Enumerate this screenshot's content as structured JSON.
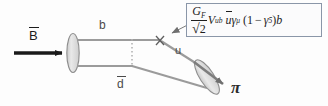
{
  "figure": {
    "kind": "feynman-diagram",
    "title_visible": false,
    "background_color": "#fdfdfd"
  },
  "labels": {
    "incoming_particle": "B",
    "incoming_particle_has_overbar": true,
    "quark_top": "b",
    "quark_bottom": "d",
    "quark_bottom_has_overbar": true,
    "quark_out": "u",
    "outgoing_particle": "π",
    "vertex_marker": "×"
  },
  "formula": {
    "full_text": "G_F/√2 V_ub ū γ_μ (1 − γ_5) b",
    "numerator": "G",
    "numerator_sub": "F",
    "denominator_radical": "√",
    "denominator_value": "2",
    "ckm": "V",
    "ckm_sub": "ub",
    "spinor": "u",
    "gamma": "γ",
    "gamma_sub": "μ",
    "paren_open": "(1",
    "minus": "−",
    "gamma5": "γ",
    "gamma5_sub": "5",
    "paren_close": ")",
    "field": "b",
    "border_color": "#8a96a8",
    "fill_color": "#fbfbfc"
  },
  "colors": {
    "line_gray": "#9b9b9b",
    "blob_fill": "#d9d9d9",
    "blob_stroke": "#8d8d8d",
    "arrow_black": "#1a1a1a",
    "arrow_gray": "#7d7d7d",
    "dotted_gray": "#b0b0b0",
    "text": "#3a3a3a"
  },
  "geometry": {
    "incoming_arrow": {
      "x1": 14,
      "y1": 53,
      "x2": 66,
      "y2": 53
    },
    "left_blob": {
      "cx": 73,
      "cy": 53,
      "rx": 6,
      "ry": 19
    },
    "top_quark_line": {
      "x1": 78,
      "y1": 40,
      "x2": 159,
      "y2": 40
    },
    "bottom_quark_line": {
      "x1": 78,
      "y1": 66,
      "x2": 133,
      "y2": 66
    },
    "spectator_line": {
      "x1": 133,
      "y1": 66,
      "x2": 209,
      "y2": 89
    },
    "dotted_line": {
      "x": 132,
      "y1": 40,
      "y2": 66
    },
    "weak_vertex": {
      "x": 160,
      "y": 40
    },
    "u_quark_line": {
      "x1": 162,
      "y1": 42,
      "x2": 209,
      "y2": 72
    },
    "right_blob": {
      "cx": 207,
      "cy": 76,
      "rx": 7,
      "ry": 20,
      "rotation": -38
    },
    "outgoing_arrow": {
      "x1": 196,
      "y1": 62,
      "x2": 228,
      "y2": 86
    },
    "pointer_line": {
      "x1": 171,
      "y1": 34,
      "x2": 206,
      "y2": 16
    }
  }
}
